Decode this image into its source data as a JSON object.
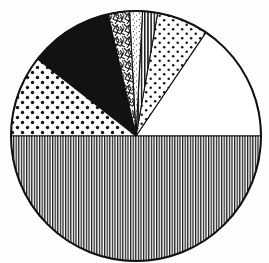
{
  "figure": {
    "title": "",
    "caption": "",
    "style": "hand-drawn scanned pie chart with black-and-white hatch fill patterns",
    "background_color": "#fdfdfc",
    "outline_color": "#111111"
  },
  "geometry": {
    "center_x": 136,
    "center_y": 136,
    "radius": 125,
    "canvas_width": 269,
    "canvas_height": 263
  },
  "chart_data": {
    "type": "pie",
    "title": "",
    "xlabel": "",
    "ylabel": "",
    "legend_position": "none",
    "grid": false,
    "start_angle_deg": 0,
    "direction": "counterclockwise",
    "labels": [
      "Blank",
      "Coarse dots",
      "Narrow vertical hatch",
      "Fine stipple",
      "Crinkle scribble",
      "Solid black",
      "Large dots",
      "Dense vertical lines"
    ],
    "values": [
      15.6,
      6.7,
      1.9,
      1.7,
      2.8,
      10.8,
      10.5,
      50.0
    ],
    "percent_labels": [
      "15.6%",
      "6.7%",
      "1.9%",
      "1.7%",
      "2.8%",
      "10.8%",
      "10.5%",
      "50.0%"
    ],
    "angles_deg": [
      {
        "start": 0,
        "end": 56
      },
      {
        "start": 56,
        "end": 80
      },
      {
        "start": 80,
        "end": 87
      },
      {
        "start": 87,
        "end": 93
      },
      {
        "start": 93,
        "end": 103
      },
      {
        "start": 103,
        "end": 142
      },
      {
        "start": 142,
        "end": 180
      },
      {
        "start": 180,
        "end": 360
      }
    ],
    "patterns": [
      "blank",
      "dots-medium",
      "vertical-hatch-narrow",
      "stipple-fine",
      "crinkle",
      "solid-black",
      "dots-large",
      "vertical-lines-dense"
    ],
    "colors": [
      "#ffffff",
      "#ffffff",
      "#ffffff",
      "#ffffff",
      "#ffffff",
      "#111111",
      "#ffffff",
      "#ffffff"
    ]
  }
}
